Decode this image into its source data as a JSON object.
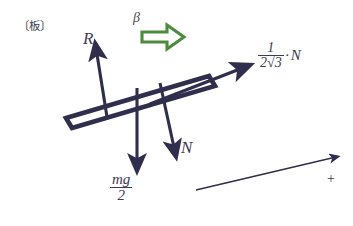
{
  "figure": {
    "title_label": "〔板〕",
    "caption_note": "",
    "colors": {
      "ink": "#2f2f4d",
      "ink_text": "#3a3a52",
      "beta_arrow_green": "#4c8b3c",
      "background": "#ffffff"
    },
    "labels": {
      "board": "〔板〕",
      "reaction_force": "R",
      "normal_force": "N",
      "beta": "β",
      "plus_axis": "+",
      "weight_numerator": "mg",
      "weight_denominator": "2",
      "friction_numerator": "1",
      "friction_denominator": "2√3",
      "friction_times": "·",
      "friction_force_symbol": "N"
    },
    "vectors": [
      {
        "name": "R",
        "label": "R",
        "direction": "up-slightly-left",
        "from": [
          107,
          113
        ],
        "to": [
          96,
          47
        ]
      },
      {
        "name": "mg/2",
        "label": "mg/2",
        "direction": "down",
        "from": [
          137,
          88
        ],
        "to": [
          137,
          168
        ]
      },
      {
        "name": "N",
        "label": "N",
        "direction": "down-right",
        "from": [
          161,
          84
        ],
        "to": [
          175,
          156
        ]
      },
      {
        "name": "friction",
        "label": "1/(2√3)·N",
        "direction": "up-right-along-board",
        "from": [
          150,
          105
        ],
        "to": [
          248,
          66
        ]
      },
      {
        "name": "beta",
        "label": "β",
        "direction": "right",
        "style": "block-arrow-green"
      },
      {
        "name": "positive-axis",
        "label": "+",
        "direction": "up-right",
        "from": [
          196,
          190
        ],
        "to": [
          338,
          157
        ]
      }
    ],
    "board": {
      "shape": "tilted-rectangular-plank",
      "tilt": "rising to the right"
    }
  }
}
